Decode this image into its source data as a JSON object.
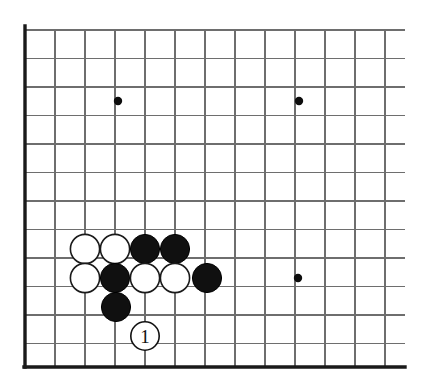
{
  "figure": {
    "board_size_note": "corner section of a 19x19 go board",
    "background_color": "#ffffff",
    "line_color": "#6e6e6e",
    "edge_color": "#1a1a1a"
  },
  "board": {
    "origin_x": 25,
    "origin_y": 30,
    "col_spacing": 30,
    "row_spacing": 28.5,
    "columns": 13,
    "rows": 12,
    "left_edge_x": 25,
    "bottom_edge_y": 367,
    "top_edge_y": 30,
    "right_extent_x": 405
  },
  "star_points": [
    {
      "name": "star-point-upper-left",
      "col": 3,
      "row": 2.5,
      "x": 118,
      "y": 101,
      "radius": 4.2
    },
    {
      "name": "star-point-upper-right",
      "col": 9,
      "row": 2.5,
      "x": 299,
      "y": 101,
      "radius": 4.2
    },
    {
      "name": "star-point-lower-right",
      "col": 9,
      "row": 8.5,
      "x": 298,
      "y": 278,
      "radius": 4.2
    }
  ],
  "stones": [
    {
      "id": "w1",
      "color": "white",
      "label": "White stone",
      "x": 85,
      "y": 249,
      "radius": 14.6
    },
    {
      "id": "w2",
      "color": "white",
      "label": "White stone",
      "x": 115,
      "y": 249,
      "radius": 14.6
    },
    {
      "id": "b1",
      "color": "black",
      "label": "Black stone",
      "x": 145,
      "y": 249,
      "radius": 14.6
    },
    {
      "id": "b2",
      "color": "black",
      "label": "Black stone",
      "x": 175,
      "y": 249,
      "radius": 14.6
    },
    {
      "id": "w3",
      "color": "white",
      "label": "White stone",
      "x": 85,
      "y": 278,
      "radius": 14.6
    },
    {
      "id": "b3",
      "color": "black",
      "label": "Black stone",
      "x": 115,
      "y": 278,
      "radius": 14.6
    },
    {
      "id": "w4",
      "color": "white",
      "label": "White stone",
      "x": 145,
      "y": 278,
      "radius": 14.6
    },
    {
      "id": "w5",
      "color": "white",
      "label": "White stone",
      "x": 175,
      "y": 278,
      "radius": 14.6
    },
    {
      "id": "b4",
      "color": "black",
      "label": "Black stone",
      "x": 207,
      "y": 278,
      "radius": 14.6
    },
    {
      "id": "b5",
      "color": "black",
      "label": "Black stone",
      "x": 116,
      "y": 307,
      "radius": 14.6
    }
  ],
  "move_markers": [
    {
      "id": "m1",
      "number": "1",
      "x": 145,
      "y": 336,
      "radius": 14.2,
      "style": "white circle with black outline"
    }
  ]
}
